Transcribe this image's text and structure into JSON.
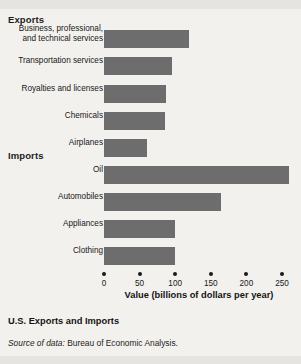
{
  "figure": {
    "caption_title": "U.S. Exports and Imports",
    "source_prefix": "Source of data:",
    "source_text": " Bureau of Economic Analysis.",
    "bar_color": "#6d6d6d",
    "background_color": "#f3f1ed"
  },
  "chart_data": {
    "type": "bar",
    "orientation": "horizontal",
    "title": "U.S. Exports and Imports",
    "xlabel": "Value (billions of dollars per year)",
    "ylabel": "",
    "xlim": [
      0,
      270
    ],
    "xticks": [
      0,
      50,
      100,
      150,
      200,
      250
    ],
    "xtick_labels": [
      "0",
      "50",
      "100",
      "150",
      "200",
      "250"
    ],
    "grid": false,
    "legend": "none",
    "groups": [
      {
        "name": "Exports",
        "categories": [
          "Business, professional,\nand technical services",
          "Transportation services",
          "Royalties and licenses",
          "Chemicals",
          "Airplanes"
        ],
        "values": [
          120,
          95,
          87,
          85,
          60
        ]
      },
      {
        "name": "Imports",
        "categories": [
          "Oil",
          "Automobiles",
          "Appliances",
          "Clothing"
        ],
        "values": [
          260,
          165,
          100,
          100
        ]
      }
    ],
    "annotations": [
      "Source of data: Bureau of Economic Analysis."
    ]
  }
}
